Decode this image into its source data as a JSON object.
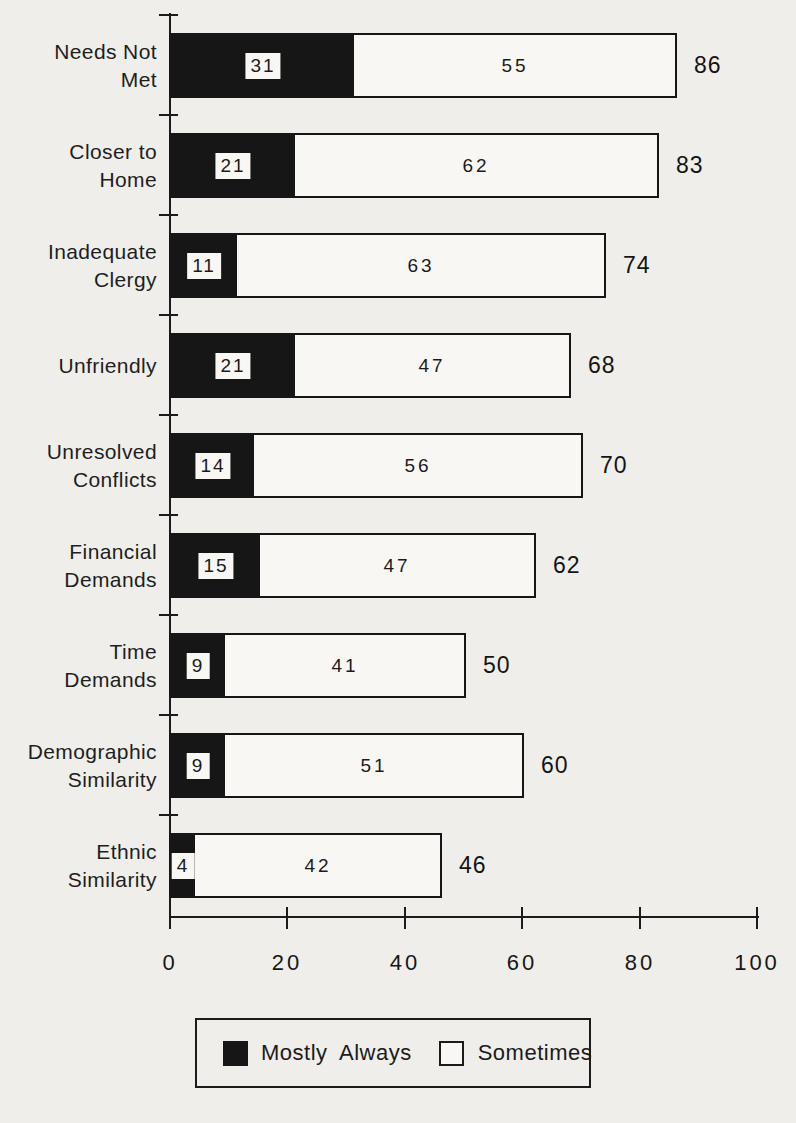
{
  "chart_data": {
    "type": "bar",
    "orientation": "horizontal",
    "stacked": true,
    "title": "",
    "xlabel": "",
    "ylabel": "",
    "categories": [
      [
        "Needs Not",
        "Met"
      ],
      [
        "Closer to",
        "Home"
      ],
      [
        "Inadequate",
        "Clergy"
      ],
      [
        "Unfriendly"
      ],
      [
        "Unresolved",
        "Conflicts"
      ],
      [
        "Financial",
        "Demands"
      ],
      [
        "Time",
        "Demands"
      ],
      [
        "Demographic",
        "Similarity"
      ],
      [
        "Ethnic",
        "Similarity"
      ]
    ],
    "series": [
      {
        "name": "Mostly Always",
        "color": "#161616",
        "values": [
          31,
          21,
          11,
          21,
          14,
          15,
          9,
          9,
          4
        ]
      },
      {
        "name": "Sometimes",
        "color": "#f8f7f4",
        "values": [
          55,
          62,
          63,
          47,
          56,
          47,
          41,
          51,
          42
        ]
      }
    ],
    "totals": [
      86,
      83,
      74,
      68,
      70,
      62,
      50,
      60,
      46
    ],
    "xlim": [
      0,
      100
    ],
    "x_ticks": [
      0,
      20,
      40,
      60,
      80,
      100
    ],
    "x_tick_labels": [
      "0",
      "20",
      "40",
      "60",
      "80",
      "100"
    ],
    "grid": false,
    "legend_position": "bottom"
  },
  "legend": {
    "items": [
      {
        "label": "Mostly Always",
        "swatch": "black"
      },
      {
        "label": "Sometimes",
        "swatch": "white"
      }
    ]
  },
  "colors": {
    "ink": "#161616",
    "paper": "#efeeea",
    "bar_fill": "#f8f7f4"
  }
}
